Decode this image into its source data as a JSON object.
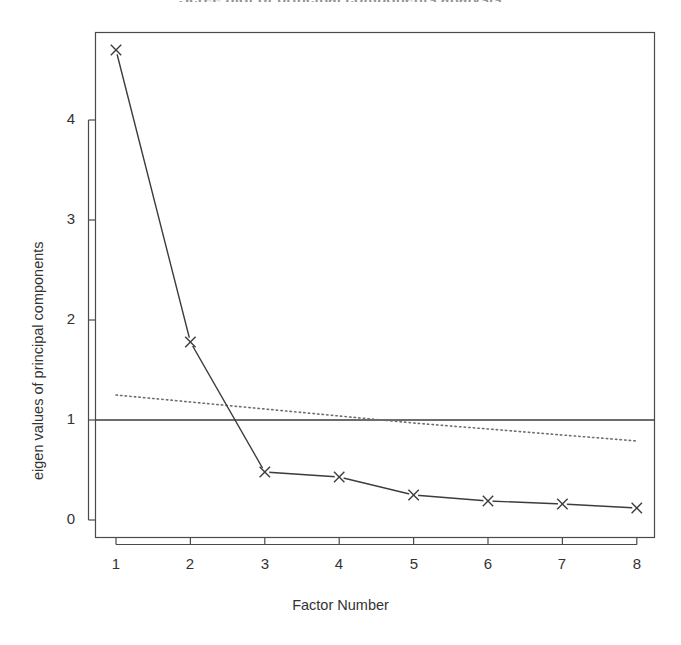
{
  "chart_data": {
    "type": "line",
    "title": "Scree plot of principal components analysis",
    "xlabel": "Factor Number",
    "ylabel": "eigen values of principal components",
    "x": [
      1,
      2,
      3,
      4,
      5,
      6,
      7,
      8
    ],
    "xticklabels": [
      "1",
      "2",
      "3",
      "4",
      "5",
      "6",
      "7",
      "8"
    ],
    "yticklabels": [
      "0",
      "1",
      "2",
      "3",
      "4"
    ],
    "yticks": [
      0,
      1,
      2,
      3,
      4
    ],
    "xlim": [
      0.6,
      8.5
    ],
    "ylim": [
      -0.12,
      4.92
    ],
    "grid": false,
    "legend": "none",
    "series": [
      {
        "name": "PC Actual Data",
        "style": "solid-line-with-x-markers",
        "marker": "x",
        "color": "#3c3c3c",
        "values": [
          4.7,
          1.78,
          0.48,
          0.43,
          0.25,
          0.19,
          0.16,
          0.12
        ]
      },
      {
        "name": "PC Simulated Data",
        "style": "dotted-line",
        "marker": "none",
        "color": "#6e6e6e",
        "values": [
          1.25,
          1.18,
          1.11,
          1.04,
          0.97,
          0.91,
          0.85,
          0.79
        ]
      },
      {
        "name": "Eigenvalue = 1 reference",
        "style": "solid-horizontal-line",
        "marker": "none",
        "color": "#3c3c3c",
        "values": [
          1,
          1,
          1,
          1,
          1,
          1,
          1,
          1
        ]
      }
    ],
    "annotations": [
      {
        "text": "Eigenvalue cutoff at 1",
        "y": 1
      }
    ]
  },
  "figure": {
    "background_color": "#ffffff",
    "frame_color": "#4a4a4a",
    "text_color": "#333333"
  }
}
